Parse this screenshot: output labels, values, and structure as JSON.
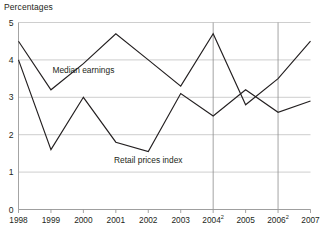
{
  "chart_data": {
    "type": "line",
    "title": "Percentages",
    "xlabel": "",
    "ylabel": "",
    "x": [
      "1998",
      "1999",
      "2000",
      "2001",
      "2002",
      "2003",
      "2004",
      "2005",
      "2006",
      "2007"
    ],
    "xtick_labels": [
      "1998",
      "1999",
      "2000",
      "2001",
      "2002",
      "2003",
      "2004",
      "2005",
      "2006",
      "2007"
    ],
    "xtick_superscripts": [
      "",
      "",
      "",
      "",
      "",
      "",
      "2",
      "",
      "2",
      ""
    ],
    "ytick_labels": [
      "0",
      "1",
      "2",
      "3",
      "4",
      "5"
    ],
    "ylim": [
      0,
      5
    ],
    "ytick_values": [
      0,
      1,
      2,
      3,
      4,
      5
    ],
    "grid": true,
    "grid_axis": "y",
    "legend": "inline-annotations",
    "vertical_reference_lines": [
      "2004",
      "2006"
    ],
    "series": [
      {
        "name": "Median earnings",
        "label_x": "2000",
        "values": [
          4.5,
          3.2,
          3.9,
          4.7,
          4.0,
          3.3,
          4.7,
          2.8,
          3.5,
          4.5
        ]
      },
      {
        "name": "Retail prices index",
        "label_x": "2002",
        "values": [
          4.0,
          1.6,
          3.0,
          1.8,
          1.55,
          3.1,
          2.5,
          3.2,
          2.6,
          2.9
        ]
      }
    ],
    "annotations": [
      {
        "text": "Median earnings",
        "x": 2000,
        "y": 3.65
      },
      {
        "text": "Retail prices index",
        "x": 2002,
        "y": 1.25
      }
    ],
    "colors": {
      "series_line": "#231f20",
      "gridline": "#b9b9b9",
      "axis": "#9a9a9a",
      "text": "#231f20",
      "background": "#ffffff"
    }
  }
}
